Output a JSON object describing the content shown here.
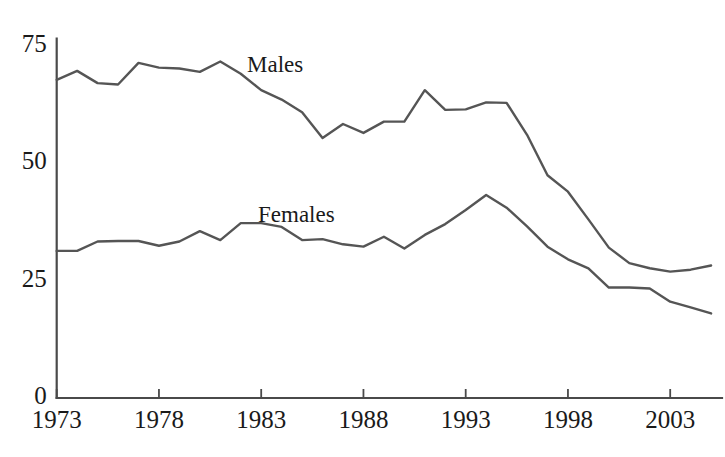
{
  "chart_data": {
    "type": "line",
    "title": "",
    "xlabel": "",
    "ylabel": "",
    "xlim": [
      1973,
      2005
    ],
    "ylim": [
      0,
      75
    ],
    "grid": false,
    "legend_position": "inline-annotation",
    "x_ticks": [
      "1973",
      "1978",
      "1983",
      "1988",
      "1993",
      "1998",
      "2003"
    ],
    "x_tick_values": [
      1973,
      1978,
      1983,
      1988,
      1993,
      1998,
      2003
    ],
    "y_ticks": [
      "0",
      "25",
      "50",
      "75"
    ],
    "y_tick_values": [
      0,
      25,
      50,
      75
    ],
    "x": [
      1973,
      1974,
      1975,
      1976,
      1977,
      1978,
      1979,
      1980,
      1981,
      1982,
      1983,
      1984,
      1985,
      1986,
      1987,
      1988,
      1989,
      1990,
      1991,
      1992,
      1993,
      1994,
      1995,
      1996,
      1997,
      1998,
      1999,
      2000,
      2001,
      2002,
      2003,
      2004,
      2005
    ],
    "series": [
      {
        "name": "Males",
        "color": "#555555",
        "label_x": 247,
        "label_y": 52,
        "values": [
          67.7,
          69.6,
          67.0,
          66.7,
          71.3,
          70.3,
          70.1,
          69.4,
          71.6,
          69.0,
          65.5,
          63.5,
          60.8,
          55.3,
          58.3,
          56.4,
          58.8,
          58.8,
          65.5,
          61.3,
          61.4,
          62.9,
          62.8,
          56.0,
          47.4,
          43.9,
          38.0,
          32.0,
          28.7,
          27.6,
          26.9,
          27.3,
          28.2
        ]
      },
      {
        "name": "Females",
        "color": "#555555",
        "label_x": 258,
        "label_y": 202,
        "values": [
          31.3,
          31.3,
          33.3,
          33.4,
          33.4,
          32.4,
          33.3,
          35.5,
          33.6,
          37.2,
          37.2,
          36.4,
          33.6,
          33.8,
          32.7,
          32.2,
          34.3,
          31.8,
          34.7,
          37.0,
          40.0,
          43.2,
          40.5,
          36.5,
          32.2,
          29.5,
          27.6,
          23.5,
          23.5,
          23.3,
          20.5,
          19.3,
          18.0
        ]
      }
    ]
  },
  "geometry": {
    "x_axis_y": 398,
    "y_axis_x": 56.7,
    "px_per_year": 20.45,
    "px_per_unit": 4.7,
    "plot_right": 722
  },
  "styling": {
    "line_color": "#555555",
    "axis_color": "#4a4a4a",
    "text_color": "#1a1a1a",
    "background": "#ffffff"
  }
}
